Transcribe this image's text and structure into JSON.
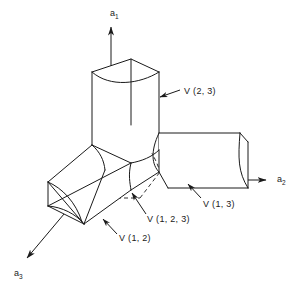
{
  "figure": {
    "background_color": "#ffffff",
    "line_color": "#1a1a1a"
  },
  "axes": [
    {
      "id": "a1",
      "base": "a",
      "subscript": "1",
      "direction": "up",
      "label_x": 110,
      "label_y": 16
    },
    {
      "id": "a2",
      "base": "a",
      "subscript": "2",
      "direction": "right",
      "label_x": 277,
      "label_y": 182
    },
    {
      "id": "a3",
      "base": "a",
      "subscript": "3",
      "direction": "down-left",
      "label_x": 14,
      "label_y": 276
    }
  ],
  "regions": [
    {
      "id": "v23",
      "label": "V (2, 3)",
      "label_x": 184,
      "label_y": 94,
      "leader_from_x": 180,
      "leader_from_y": 90,
      "leader_to_x": 160,
      "leader_to_y": 97
    },
    {
      "id": "v13",
      "label": "V (1, 3)",
      "label_x": 203,
      "label_y": 207,
      "leader_from_x": 201,
      "leader_from_y": 198,
      "leader_to_x": 188,
      "leader_to_y": 184
    },
    {
      "id": "v123",
      "label": "V (1, 2, 3)",
      "label_x": 147,
      "label_y": 222,
      "leader_from_x": 146,
      "leader_from_y": 214,
      "leader_to_x": 132,
      "leader_to_y": 193
    },
    {
      "id": "v12",
      "label": "V (1, 2)",
      "label_x": 119,
      "label_y": 241,
      "leader_from_x": 117,
      "leader_from_y": 234,
      "leader_to_x": 103,
      "leader_to_y": 219
    }
  ]
}
